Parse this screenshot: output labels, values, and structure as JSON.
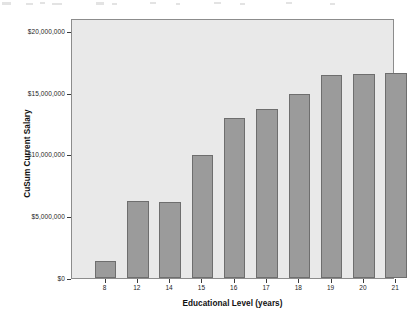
{
  "chart_data": {
    "type": "bar",
    "title": "",
    "subtitle": "",
    "xlabel": "Educational Level (years)",
    "ylabel": "CuSum Current Salary",
    "categories": [
      "8",
      "12",
      "14",
      "15",
      "16",
      "17",
      "18",
      "19",
      "20",
      "21"
    ],
    "values": [
      1400000,
      6200000,
      6150000,
      10000000,
      12950000,
      13700000,
      14900000,
      16400000,
      16500000,
      16600000
    ],
    "ylim": [
      0,
      21050000
    ],
    "ytick_values": [
      0,
      5000000,
      10000000,
      15000000,
      20000000
    ],
    "ytick_labels": [
      "$0",
      "$5,000,000",
      "$10,000,000",
      "$15,000,000",
      "$20,000,000"
    ],
    "grid": false,
    "legend": "none",
    "bar_fill_color": "#9b9b9b",
    "bar_border_color": "#6e6e6e",
    "plot_background_color": "#e9e9e9",
    "figure_background_color": "#ffffff",
    "axis_text_color": "#1d1d1d"
  }
}
